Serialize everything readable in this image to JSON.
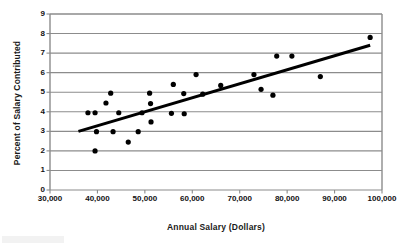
{
  "chart_data": {
    "type": "scatter",
    "title": "",
    "xlabel": "Annual Salary (Dollars)",
    "ylabel": "Percent of Salary Contributed",
    "xlim": [
      30000,
      100000
    ],
    "ylim": [
      0,
      9
    ],
    "xticks": [
      "30,000",
      "40,000",
      "50,000",
      "60,000",
      "70,000",
      "80,000",
      "90,000",
      "100,000"
    ],
    "xtick_values": [
      30000,
      40000,
      50000,
      60000,
      70000,
      80000,
      90000,
      100000
    ],
    "yticks": [
      "0",
      "1",
      "2",
      "3",
      "4",
      "5",
      "6",
      "7",
      "8",
      "9"
    ],
    "ytick_values": [
      0,
      1,
      2,
      3,
      4,
      5,
      6,
      7,
      8,
      9
    ],
    "grid": "horizontal",
    "legend": "none",
    "marker_color": "#000000",
    "marker_shape": "circle",
    "trendline_color": "#000000",
    "points": [
      {
        "x": 38000,
        "y": 3.95
      },
      {
        "x": 39500,
        "y": 3.95
      },
      {
        "x": 39500,
        "y": 2.0
      },
      {
        "x": 39800,
        "y": 2.98
      },
      {
        "x": 41800,
        "y": 4.45
      },
      {
        "x": 42800,
        "y": 4.95
      },
      {
        "x": 43300,
        "y": 2.98
      },
      {
        "x": 44500,
        "y": 3.95
      },
      {
        "x": 46500,
        "y": 2.45
      },
      {
        "x": 48600,
        "y": 2.98
      },
      {
        "x": 49400,
        "y": 3.95
      },
      {
        "x": 51000,
        "y": 4.95
      },
      {
        "x": 51200,
        "y": 4.42
      },
      {
        "x": 51300,
        "y": 3.48
      },
      {
        "x": 55600,
        "y": 3.92
      },
      {
        "x": 56000,
        "y": 5.4
      },
      {
        "x": 58200,
        "y": 4.93
      },
      {
        "x": 58300,
        "y": 3.9
      },
      {
        "x": 60800,
        "y": 5.9
      },
      {
        "x": 62200,
        "y": 4.9
      },
      {
        "x": 66000,
        "y": 5.35
      },
      {
        "x": 73000,
        "y": 5.9
      },
      {
        "x": 74500,
        "y": 5.15
      },
      {
        "x": 77000,
        "y": 4.85
      },
      {
        "x": 77800,
        "y": 6.85
      },
      {
        "x": 81000,
        "y": 6.85
      },
      {
        "x": 87000,
        "y": 5.8
      },
      {
        "x": 97500,
        "y": 7.8
      }
    ],
    "trendline": {
      "x_start": 36000,
      "y_start": 3.0,
      "x_end": 97500,
      "y_end": 7.4
    }
  }
}
